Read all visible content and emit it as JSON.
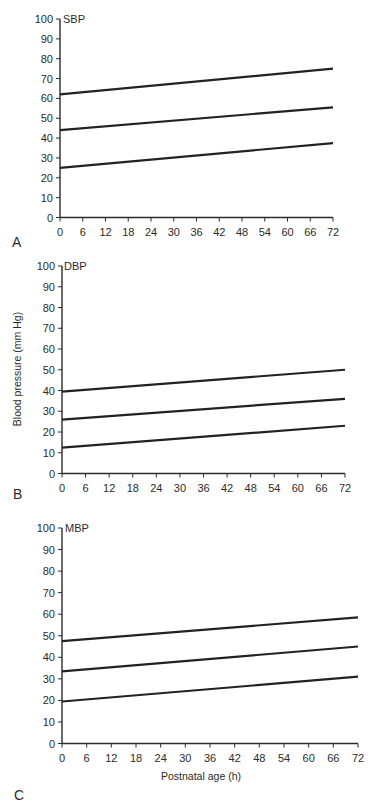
{
  "figure": {
    "y_axis_title": "Blood pressure (mm Hg)",
    "x_axis_title": "Postnatal age (h)"
  },
  "chart_data": [
    {
      "type": "line",
      "panel": "A",
      "title": "SBP",
      "xlabel": "",
      "ylabel": "",
      "x": [
        0,
        72
      ],
      "xticks": [
        0,
        6,
        12,
        18,
        24,
        30,
        36,
        42,
        48,
        54,
        60,
        66,
        72
      ],
      "yticks": [
        0,
        10,
        20,
        30,
        40,
        50,
        60,
        70,
        80,
        90,
        100
      ],
      "xlim": [
        0,
        72
      ],
      "ylim": [
        0,
        100
      ],
      "grid": false,
      "legend": "none",
      "series": [
        {
          "name": "upper",
          "x": [
            0,
            72
          ],
          "values": [
            62,
            75
          ]
        },
        {
          "name": "middle",
          "x": [
            0,
            72
          ],
          "values": [
            44,
            55.5
          ]
        },
        {
          "name": "lower",
          "x": [
            0,
            72
          ],
          "values": [
            25,
            37.5
          ]
        }
      ]
    },
    {
      "type": "line",
      "panel": "B",
      "title": "DBP",
      "xlabel": "",
      "ylabel": "Blood pressure (mm Hg)",
      "x": [
        0,
        72
      ],
      "xticks": [
        0,
        6,
        12,
        18,
        24,
        30,
        36,
        42,
        48,
        54,
        60,
        66,
        72
      ],
      "yticks": [
        0,
        10,
        20,
        30,
        40,
        50,
        60,
        70,
        80,
        90,
        100
      ],
      "xlim": [
        0,
        72
      ],
      "ylim": [
        0,
        100
      ],
      "grid": false,
      "legend": "none",
      "series": [
        {
          "name": "upper",
          "x": [
            0,
            72
          ],
          "values": [
            39.5,
            50
          ]
        },
        {
          "name": "middle",
          "x": [
            0,
            72
          ],
          "values": [
            26,
            36
          ]
        },
        {
          "name": "lower",
          "x": [
            0,
            72
          ],
          "values": [
            12.5,
            23
          ]
        }
      ]
    },
    {
      "type": "line",
      "panel": "C",
      "title": "MBP",
      "xlabel": "Postnatal age (h)",
      "ylabel": "",
      "x": [
        0,
        72
      ],
      "xticks": [
        0,
        6,
        12,
        18,
        24,
        30,
        36,
        42,
        48,
        54,
        60,
        66,
        72
      ],
      "yticks": [
        0,
        10,
        20,
        30,
        40,
        50,
        60,
        70,
        80,
        90,
        100
      ],
      "xlim": [
        0,
        72
      ],
      "ylim": [
        0,
        100
      ],
      "grid": false,
      "legend": "none",
      "series": [
        {
          "name": "upper",
          "x": [
            0,
            72
          ],
          "values": [
            47.5,
            58.5
          ]
        },
        {
          "name": "middle",
          "x": [
            0,
            72
          ],
          "values": [
            33.5,
            45
          ]
        },
        {
          "name": "lower",
          "x": [
            0,
            72
          ],
          "values": [
            19.5,
            31
          ]
        }
      ]
    }
  ]
}
